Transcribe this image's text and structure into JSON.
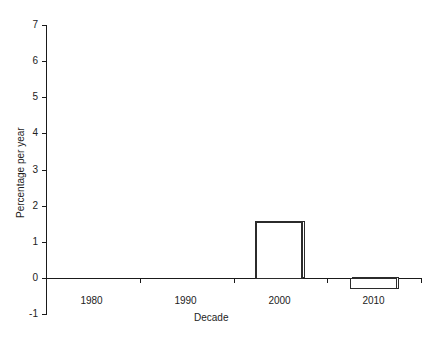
{
  "chart_data": {
    "type": "bar",
    "title": "",
    "subtitle": "",
    "xlabel": "Decade",
    "ylabel": "Percentage per year",
    "categories": [
      "1980",
      "1990",
      "2000",
      "2010"
    ],
    "values": [
      6.5,
      3.8,
      1.55,
      -0.3
    ],
    "series": [
      {
        "name": "Percentage per year",
        "values": [
          6.5,
          3.8,
          1.55,
          -0.3
        ]
      }
    ],
    "ylim": [
      -1,
      7
    ],
    "yticks": [
      -1,
      0,
      1,
      2,
      3,
      4,
      5,
      6,
      7
    ],
    "ytick_labels": [
      "-1",
      "0",
      "1",
      "2",
      "3",
      "4",
      "5",
      "6",
      "7"
    ],
    "xtick_labels": [
      "1980",
      "1990",
      "2000",
      "2010"
    ],
    "grid": false,
    "legend": false,
    "legend_position": "none",
    "bar_fill": "#ffffff",
    "bar_edge_color": "#2b2b2b",
    "axis_color": "#1a1a1a",
    "background": "#ffffff"
  },
  "axes": {
    "y_title": "Percentage per year",
    "x_title": "Decade"
  }
}
